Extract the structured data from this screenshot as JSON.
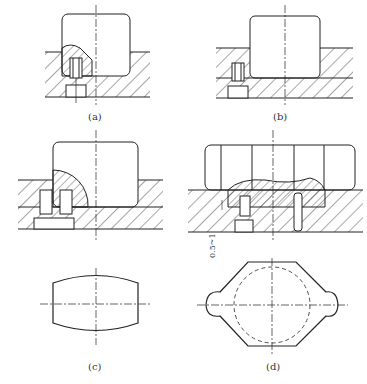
{
  "figure": {
    "captions": {
      "a": "(a)",
      "b": "(b)",
      "c": "(c)",
      "d": "(d)"
    },
    "dimension_label": "0.5~1",
    "panels": [
      {
        "id": "a",
        "description": "Die cross-section with partially shaped workpiece, single ejector pin"
      },
      {
        "id": "b",
        "description": "Die cross-section with punch inserted, single ejector pin"
      },
      {
        "id": "c",
        "description": "Die cross-section with quarter-round insert and two bolts; plan view of barrel-shaped blank"
      },
      {
        "id": "d",
        "description": "Die cross-section with wavy-top insert, gap 0.5~1; plan view of octagonal flange with dashed circle"
      }
    ]
  }
}
